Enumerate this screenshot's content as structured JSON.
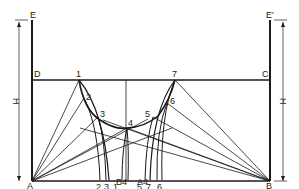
{
  "points": {
    "A": "A",
    "B": "B",
    "C": "C",
    "D": "D",
    "E": "E",
    "E2": "E'",
    "p1": "1",
    "p2": "2",
    "p3": "3",
    "p4": "4",
    "p5": "5",
    "p6": "6",
    "p7": "7"
  },
  "dimension": {
    "left": "H",
    "right": "H"
  },
  "bottom_labels": {
    "b2": "2",
    "b3": "3",
    "b1": "1",
    "b5": "5",
    "b7": "7",
    "b6": "6",
    "B4": "B4",
    "A4": "A4"
  },
  "colors": {
    "line": "#1a1a1a",
    "background": "#ffffff"
  }
}
